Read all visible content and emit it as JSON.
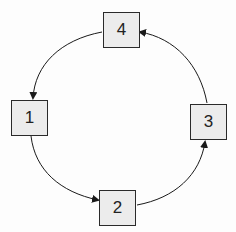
{
  "diagram": {
    "type": "cycle",
    "nodes": [
      {
        "id": "1",
        "label": "1"
      },
      {
        "id": "2",
        "label": "2"
      },
      {
        "id": "3",
        "label": "3"
      },
      {
        "id": "4",
        "label": "4"
      }
    ],
    "edges": [
      {
        "from": "1",
        "to": "2"
      },
      {
        "from": "2",
        "to": "3"
      },
      {
        "from": "3",
        "to": "4"
      },
      {
        "from": "4",
        "to": "1"
      }
    ],
    "colors": {
      "node_fill": "#ececec",
      "stroke": "#2a2a2a"
    }
  }
}
